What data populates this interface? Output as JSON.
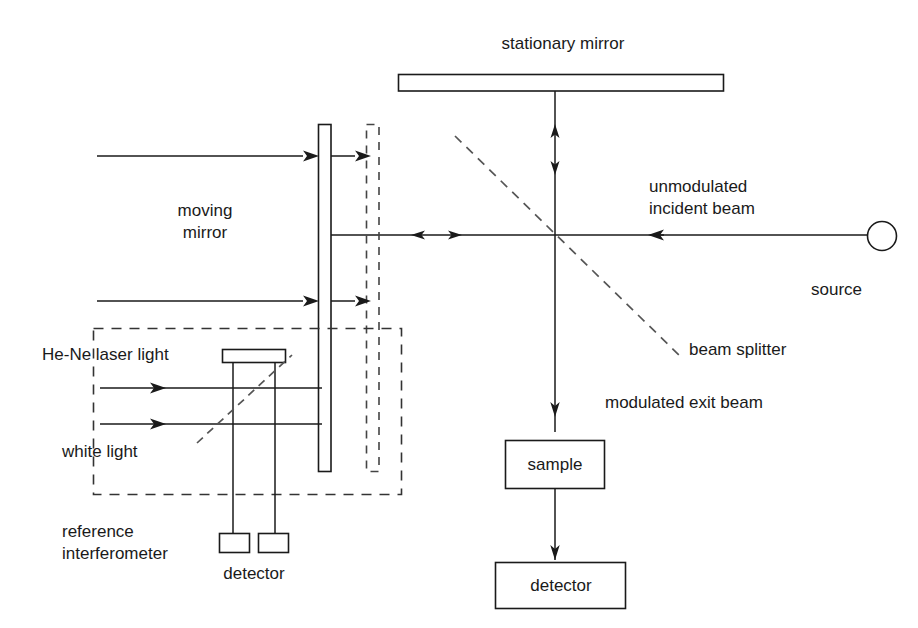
{
  "diagram": {
    "stroke_color": "#1a1a1a",
    "background_color": "#ffffff",
    "labels": {
      "stationary_mirror": "stationary mirror",
      "moving_mirror_line1": "moving",
      "moving_mirror_line2": "mirror",
      "unmodulated_line1": "unmodulated",
      "unmodulated_line2": "incident beam",
      "source": "source",
      "beam_splitter": "beam splitter",
      "modulated_exit_beam": "modulated exit beam",
      "sample": "sample",
      "detector_main": "detector",
      "he_ne_laser_light": "He-Ne laser light",
      "white_light": "white light",
      "reference_line1": "reference",
      "reference_line2": "interferometer",
      "detector_reference": "detector"
    },
    "components": [
      {
        "name": "stationary-mirror",
        "shape": "rect",
        "x": 398,
        "y": 74,
        "w": 326,
        "h": 17,
        "style": "solid"
      },
      {
        "name": "moving-mirror",
        "shape": "rect",
        "x": 318,
        "y": 124,
        "w": 13,
        "h": 348,
        "style": "solid"
      },
      {
        "name": "moving-mirror-displaced",
        "shape": "rect",
        "x": 366,
        "y": 124,
        "w": 13,
        "h": 348,
        "style": "dashed"
      },
      {
        "name": "reference-interferometer-boundary",
        "shape": "rect",
        "x": 93,
        "y": 328,
        "w": 309,
        "h": 167,
        "style": "dashed"
      },
      {
        "name": "reference-mirror",
        "shape": "rect",
        "x": 222,
        "y": 349,
        "w": 64,
        "h": 14,
        "style": "solid"
      },
      {
        "name": "reference-detector-left",
        "shape": "rect",
        "x": 219,
        "y": 533,
        "w": 31,
        "h": 20,
        "style": "solid"
      },
      {
        "name": "reference-detector-right",
        "shape": "rect",
        "x": 258,
        "y": 533,
        "w": 31,
        "h": 20,
        "style": "solid"
      },
      {
        "name": "sample-box",
        "shape": "rect",
        "x": 505,
        "y": 440,
        "w": 100,
        "h": 49,
        "style": "solid"
      },
      {
        "name": "detector-box",
        "shape": "rect",
        "x": 495,
        "y": 562,
        "w": 131,
        "h": 47,
        "style": "solid"
      },
      {
        "name": "source-lamp",
        "shape": "circle",
        "cx": 882,
        "cy": 236,
        "r": 14,
        "style": "solid"
      },
      {
        "name": "beam-splitter",
        "shape": "dashed-diagonal",
        "x1": 455,
        "y1": 137,
        "x2": 680,
        "y2": 356
      }
    ],
    "beams": [
      {
        "name": "incident-beam-from-source",
        "direction": "left"
      },
      {
        "name": "beam-to-stationary-mirror",
        "direction": "bidirectional-vertical"
      },
      {
        "name": "beam-to-moving-mirror",
        "direction": "bidirectional-horizontal"
      },
      {
        "name": "modulated-exit-beam",
        "direction": "down"
      },
      {
        "name": "sample-to-detector",
        "direction": "down"
      },
      {
        "name": "he-ne-laser-beam",
        "direction": "right"
      },
      {
        "name": "white-light-beam",
        "direction": "right"
      }
    ]
  }
}
